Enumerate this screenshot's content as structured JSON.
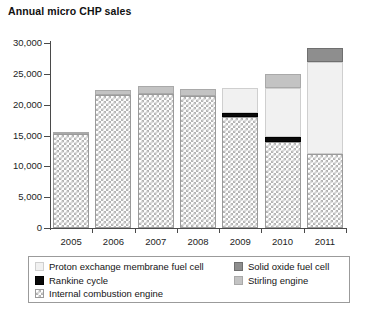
{
  "chart_data": {
    "type": "bar",
    "subtype": "stacked-bar",
    "title": "Annual micro CHP sales",
    "xlabel": "",
    "ylabel": "",
    "ylim": [
      0,
      30000
    ],
    "yticks": [
      "0",
      "5,000",
      "10,000",
      "15,000",
      "20,000",
      "25,000",
      "30,000"
    ],
    "ytick_values": [
      0,
      5000,
      10000,
      15000,
      20000,
      25000,
      30000
    ],
    "grid": false,
    "legend_position": "bottom",
    "categories": [
      "2005",
      "2006",
      "2007",
      "2008",
      "2009",
      "2010",
      "2011"
    ],
    "series": [
      {
        "name": "Internal combustion engine",
        "color": "#b4b4b4",
        "pattern": "cross-hatch",
        "values": [
          15200,
          21500,
          21800,
          21400,
          18000,
          14000,
          12000
        ]
      },
      {
        "name": "Rankine cycle",
        "color": "#090909",
        "pattern": "solid",
        "values": [
          0,
          0,
          0,
          0,
          700,
          700,
          0
        ]
      },
      {
        "name": "Proton exchange membrane fuel cell",
        "color": "#f1f1f1",
        "pattern": "solid",
        "values": [
          0,
          0,
          0,
          0,
          4000,
          8000,
          15000
        ]
      },
      {
        "name": "Stirling engine",
        "color": "#c3c3c3",
        "pattern": "solid",
        "values": [
          400,
          900,
          1300,
          1100,
          0,
          2300,
          0
        ]
      },
      {
        "name": "Solid oxide fuel cell",
        "color": "#8e8e8e",
        "pattern": "solid",
        "values": [
          0,
          0,
          0,
          0,
          0,
          0,
          2200
        ]
      }
    ],
    "totals": [
      15600,
      22400,
      23100,
      22500,
      22700,
      25000,
      29200
    ]
  },
  "legend": {
    "left_column": [
      {
        "label": "Proton exchange membrane fuel cell",
        "swatch": "pem-swatch"
      },
      {
        "label": "Rankine cycle",
        "swatch": "rankine-swatch"
      },
      {
        "label": "Internal combustion engine",
        "swatch": "ice-swatch"
      }
    ],
    "right_column": [
      {
        "label": "Solid oxide fuel cell",
        "swatch": "sofc-swatch"
      },
      {
        "label": "Stirling engine",
        "swatch": "stirling-swatch"
      }
    ]
  }
}
